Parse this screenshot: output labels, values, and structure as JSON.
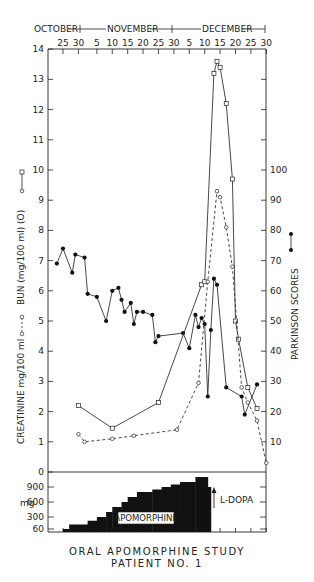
{
  "chart_data": {
    "type": "line",
    "title": "ORAL APOMORPHINE STUDY",
    "subtitle": "PATIENT NO. 1",
    "months": [
      "OCTOBER",
      "NOVEMBER",
      "DECEMBER"
    ],
    "x_tick_labels": [
      "25",
      "30",
      "5",
      "10",
      "15",
      "20",
      "25",
      "30",
      "5",
      "10",
      "15",
      "20",
      "25",
      "30"
    ],
    "left_axis": {
      "label_bun": "BUN (mg/100 ml (O))",
      "label_creatinine": "CREATININE mg/100 ml",
      "ticks": [
        0,
        1,
        2,
        3,
        4,
        5,
        6,
        7,
        8,
        9,
        10,
        11,
        12,
        13,
        14
      ],
      "ylim": [
        0,
        14
      ]
    },
    "right_axis": {
      "label": "PARKINSON SCORES",
      "ticks": [
        10,
        20,
        30,
        40,
        50,
        60,
        70,
        80,
        90,
        100
      ],
      "ylim": [
        0,
        140
      ]
    },
    "series": [
      {
        "name": "Parkinson scores",
        "marker": "filled-circle",
        "line": "solid",
        "axis": "right",
        "points": [
          {
            "date": "Oct 23",
            "value": 69
          },
          {
            "date": "Oct 25",
            "value": 74
          },
          {
            "date": "Oct 28",
            "value": 66
          },
          {
            "date": "Oct 29",
            "value": 72
          },
          {
            "date": "Nov 1",
            "value": 71
          },
          {
            "date": "Nov 2",
            "value": 59
          },
          {
            "date": "Nov 5",
            "value": 58
          },
          {
            "date": "Nov 8",
            "value": 50
          },
          {
            "date": "Nov 10",
            "value": 60
          },
          {
            "date": "Nov 12",
            "value": 61
          },
          {
            "date": "Nov 13",
            "value": 57
          },
          {
            "date": "Nov 14",
            "value": 53
          },
          {
            "date": "Nov 16",
            "value": 56
          },
          {
            "date": "Nov 17",
            "value": 49
          },
          {
            "date": "Nov 18",
            "value": 53
          },
          {
            "date": "Nov 20",
            "value": 53
          },
          {
            "date": "Nov 23",
            "value": 52
          },
          {
            "date": "Nov 24",
            "value": 43
          },
          {
            "date": "Nov 25",
            "value": 45
          },
          {
            "date": "Dec 3",
            "value": 46
          },
          {
            "date": "Dec 5",
            "value": 41
          },
          {
            "date": "Dec 7",
            "value": 52
          },
          {
            "date": "Dec 8",
            "value": 48
          },
          {
            "date": "Dec 9",
            "value": 51
          },
          {
            "date": "Dec 10",
            "value": 49
          },
          {
            "date": "Dec 11",
            "value": 25
          },
          {
            "date": "Dec 12",
            "value": 47
          },
          {
            "date": "Dec 13",
            "value": 64
          },
          {
            "date": "Dec 14",
            "value": 62
          },
          {
            "date": "Dec 17",
            "value": 28
          },
          {
            "date": "Dec 22",
            "value": 25
          },
          {
            "date": "Dec 23",
            "value": 19
          },
          {
            "date": "Dec 27",
            "value": 29
          }
        ]
      },
      {
        "name": "BUN (mg/100 ml)",
        "marker": "open-square",
        "line": "solid",
        "axis": "left",
        "points": [
          {
            "date": "Oct 30",
            "value": 2.2
          },
          {
            "date": "Nov 10",
            "value": 1.45
          },
          {
            "date": "Nov 25",
            "value": 2.3
          },
          {
            "date": "Dec 9",
            "value": 6.2
          },
          {
            "date": "Dec 10",
            "value": 6.3
          },
          {
            "date": "Dec 13",
            "value": 13.2
          },
          {
            "date": "Dec 14",
            "value": 13.6
          },
          {
            "date": "Dec 15",
            "value": 13.4
          },
          {
            "date": "Dec 17",
            "value": 12.2
          },
          {
            "date": "Dec 19",
            "value": 9.7
          },
          {
            "date": "Dec 20",
            "value": 5.0
          },
          {
            "date": "Dec 21",
            "value": 4.4
          },
          {
            "date": "Dec 24",
            "value": 2.8
          },
          {
            "date": "Dec 27",
            "value": 2.1
          }
        ]
      },
      {
        "name": "Creatinine (mg/100 ml)",
        "marker": "open-circle",
        "line": "dashed",
        "axis": "left",
        "points": [
          {
            "date": "Oct 30",
            "value": 1.25
          },
          {
            "date": "Nov 1",
            "value": 1.0
          },
          {
            "date": "Nov 10",
            "value": 1.1
          },
          {
            "date": "Nov 17",
            "value": 1.2
          },
          {
            "date": "Dec 1",
            "value": 1.4
          },
          {
            "date": "Dec 8",
            "value": 2.95
          },
          {
            "date": "Dec 11",
            "value": 6.3
          },
          {
            "date": "Dec 14",
            "value": 9.3
          },
          {
            "date": "Dec 15",
            "value": 9.1
          },
          {
            "date": "Dec 17",
            "value": 8.1
          },
          {
            "date": "Dec 19",
            "value": 6.8
          },
          {
            "date": "Dec 22",
            "value": 2.8
          },
          {
            "date": "Dec 24",
            "value": 2.3
          },
          {
            "date": "Dec 27",
            "value": 1.7
          },
          {
            "date": "Dec 30",
            "value": 0.3
          }
        ]
      }
    ],
    "dose_panel": {
      "ylabel": "mg",
      "ticks": [
        60,
        300,
        600,
        900
      ],
      "bar_label": "APOMORPHINE",
      "annotation": "L-DOPA",
      "steps": [
        {
          "from": "Oct 25",
          "to": "Oct 27",
          "mg": 60
        },
        {
          "from": "Oct 27",
          "to": "Nov 2",
          "mg": 150
        },
        {
          "from": "Nov 2",
          "to": "Nov 5",
          "mg": 225
        },
        {
          "from": "Nov 5",
          "to": "Nov 8",
          "mg": 300
        },
        {
          "from": "Nov 8",
          "to": "Nov 10",
          "mg": 400
        },
        {
          "from": "Nov 10",
          "to": "Nov 13",
          "mg": 500
        },
        {
          "from": "Nov 13",
          "to": "Nov 15",
          "mg": 600
        },
        {
          "from": "Nov 15",
          "to": "Nov 18",
          "mg": 700
        },
        {
          "from": "Nov 18",
          "to": "Nov 23",
          "mg": 800
        },
        {
          "from": "Nov 23",
          "to": "Nov 26",
          "mg": 850
        },
        {
          "from": "Nov 26",
          "to": "Nov 29",
          "mg": 900
        },
        {
          "from": "Nov 29",
          "to": "Dec 2",
          "mg": 950
        },
        {
          "from": "Dec 2",
          "to": "Dec 7",
          "mg": 1000
        },
        {
          "from": "Dec 7",
          "to": "Dec 11",
          "mg": 1100
        },
        {
          "from": "Dec 11",
          "to": "Dec 12",
          "mg": 900
        }
      ]
    }
  },
  "labels": {
    "month_oct": "OCTOBER",
    "month_nov": "NOVEMBER",
    "month_dec": "DECEMBER",
    "bun_axis": "BUN (mg/100 ml) (O)",
    "creatinine_axis": "CREATININE mg/100 ml",
    "parkinson_axis": "PARKINSON SCORES",
    "dose_unit": "mg",
    "apomorphine": "APOMORPHINE",
    "ldopa": "L-DOPA",
    "title_line1": "ORAL APOMORPHINE STUDY",
    "title_line2": "PATIENT NO. 1"
  }
}
